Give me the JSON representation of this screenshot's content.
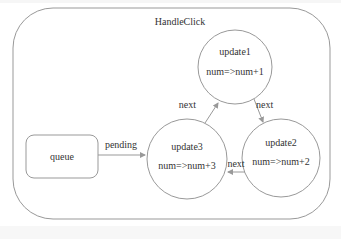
{
  "diagram": {
    "container_label": "HandleClick",
    "queue_label": "queue",
    "pending_label": "pending",
    "nodes": [
      {
        "name": "update1",
        "expr": "num=>num+1"
      },
      {
        "name": "update2",
        "expr": "num=>num+2"
      },
      {
        "name": "update3",
        "expr": "num=>num+3"
      }
    ],
    "edges": [
      {
        "from": "queue",
        "to": "update3",
        "label": "pending"
      },
      {
        "from": "update3",
        "to": "update1",
        "label": "next"
      },
      {
        "from": "update1",
        "to": "update2",
        "label": "next"
      },
      {
        "from": "update2",
        "to": "update3",
        "label": "next"
      }
    ],
    "colors": {
      "stroke": "#999999",
      "text": "#333333",
      "background": "#ffffff"
    }
  }
}
